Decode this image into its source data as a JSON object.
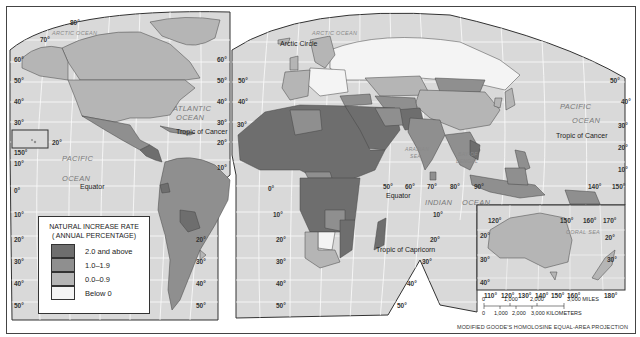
{
  "map": {
    "title": "Natural Increase Rate",
    "projection": "MODIFIED GOODE'S HOMOLOSINE EQUAL-AREA PROJECTION",
    "legend": {
      "title_line1": "NATURAL INCREASE RATE",
      "title_line2": "( ANNUAL PERCENTAGE)",
      "items": [
        {
          "label": "2.0 and above",
          "color": "#6e6e6e"
        },
        {
          "label": "1.0–1.9",
          "color": "#8f8f8f"
        },
        {
          "label": "0.0–0.9",
          "color": "#b5b5b5"
        },
        {
          "label": "Below 0",
          "color": "#f4f4f4"
        }
      ]
    },
    "lines": {
      "arctic_circle": "Arctic Circle",
      "tropic_cancer_w": "Tropic of Cancer",
      "tropic_cancer_e": "Tropic of Cancer",
      "equator_w": "Equator",
      "equator_e": "Equator",
      "tropic_capricorn": "Tropic of Capricorn"
    },
    "oceans": {
      "arctic_w": "ARCTIC OCEAN",
      "arctic_e": "ARCTIC OCEAN",
      "atlantic_1": "ATLANTIC",
      "atlantic_2": "OCEAN",
      "pacific_w1": "PACIFIC",
      "pacific_w2": "OCEAN",
      "pacific_e1": "PACIFIC",
      "pacific_e2": "OCEAN",
      "indian_1": "INDIAN",
      "indian_2": "OCEAN",
      "arabian_1": "ARABIAN",
      "arabian_2": "SEA",
      "bengal_1": "BAY OF",
      "bengal_2": "BENGAL",
      "coral": "CORAL SEA"
    },
    "lat_labels_left": [
      "80°",
      "70°",
      "60°",
      "50°",
      "40°",
      "30°",
      "20°",
      "10°",
      "0°",
      "10°",
      "20°",
      "30°",
      "40°",
      "50°"
    ],
    "lat_labels_mid": [
      "60°",
      "50°",
      "40°",
      "30°",
      "20°",
      "10°"
    ],
    "lat_labels_africa": [
      "10°",
      "20°",
      "30°",
      "40°",
      "50°"
    ],
    "lat_labels_sa": [
      "10°",
      "20°",
      "30°",
      "40°",
      "50°"
    ],
    "lat_labels_right": [
      "50°",
      "40°",
      "30°",
      "20°",
      "10°"
    ],
    "lon_labels_equator": [
      "0°",
      "50°",
      "60°",
      "70°",
      "80°",
      "90°",
      "140°",
      "150°"
    ],
    "hawaii_lon": "150°",
    "inset": {
      "top_lon": [
        "120°",
        "150°",
        "160°",
        "170°"
      ],
      "bottom_lon": [
        "110°",
        "120°",
        "130°",
        "140°",
        "150°",
        "160°",
        "180°"
      ],
      "lat": [
        "20°",
        "30°",
        "40°"
      ],
      "lat_right": [
        "20°",
        "30°"
      ]
    },
    "scale": {
      "miles": [
        "0",
        "1,000",
        "2,000",
        "3,000 MILES"
      ],
      "km": [
        "0",
        "1,000",
        "2,000",
        "3,000 KILOMETERS"
      ]
    },
    "extra_lat": {
      "af_30": "30°",
      "asia_10": "10°",
      "ind_10": "10°",
      "ind_20": "20°",
      "ind_30": "30°",
      "ind_40": "40°",
      "ind_50": "50°"
    }
  }
}
